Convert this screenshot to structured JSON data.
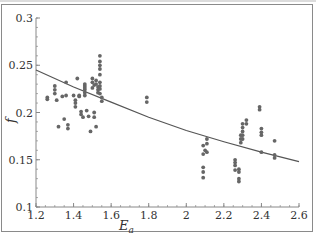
{
  "chart_data": {
    "type": "scatter",
    "title": "",
    "xlabel": "E_a",
    "ylabel": "f",
    "xlim": [
      1.2,
      2.6
    ],
    "ylim": [
      0.1,
      0.3
    ],
    "x_ticks": [
      "1.2",
      "1.4",
      "1.6",
      "1.8",
      "2",
      "2.2",
      "2.4",
      "2.6"
    ],
    "y_ticks": [
      "0.1",
      "0.15",
      "0.2",
      "0.25",
      "0.3"
    ],
    "grid": false,
    "legend": null,
    "series": [
      {
        "name": "data",
        "kind": "scatter",
        "color": "#666666",
        "points": [
          [
            1.26,
            0.216
          ],
          [
            1.26,
            0.214
          ],
          [
            1.3,
            0.228
          ],
          [
            1.3,
            0.224
          ],
          [
            1.3,
            0.22
          ],
          [
            1.31,
            0.213
          ],
          [
            1.32,
            0.185
          ],
          [
            1.34,
            0.217
          ],
          [
            1.35,
            0.193
          ],
          [
            1.36,
            0.232
          ],
          [
            1.36,
            0.218
          ],
          [
            1.37,
            0.187
          ],
          [
            1.37,
            0.183
          ],
          [
            1.4,
            0.218
          ],
          [
            1.41,
            0.213
          ],
          [
            1.41,
            0.21
          ],
          [
            1.41,
            0.206
          ],
          [
            1.42,
            0.236
          ],
          [
            1.43,
            0.218
          ],
          [
            1.43,
            0.217
          ],
          [
            1.44,
            0.201
          ],
          [
            1.44,
            0.198
          ],
          [
            1.45,
            0.195
          ],
          [
            1.46,
            0.218
          ],
          [
            1.46,
            0.221
          ],
          [
            1.46,
            0.224
          ],
          [
            1.46,
            0.226
          ],
          [
            1.46,
            0.228
          ],
          [
            1.46,
            0.23
          ],
          [
            1.47,
            0.202
          ],
          [
            1.48,
            0.196
          ],
          [
            1.49,
            0.18
          ],
          [
            1.5,
            0.232
          ],
          [
            1.5,
            0.236
          ],
          [
            1.5,
            0.226
          ],
          [
            1.51,
            0.229
          ],
          [
            1.51,
            0.2
          ],
          [
            1.51,
            0.195
          ],
          [
            1.52,
            0.185
          ],
          [
            1.52,
            0.234
          ],
          [
            1.52,
            0.23
          ],
          [
            1.53,
            0.227
          ],
          [
            1.53,
            0.224
          ],
          [
            1.53,
            0.221
          ],
          [
            1.54,
            0.26
          ],
          [
            1.54,
            0.254
          ],
          [
            1.54,
            0.25
          ],
          [
            1.54,
            0.246
          ],
          [
            1.54,
            0.24
          ],
          [
            1.54,
            0.232
          ],
          [
            1.54,
            0.228
          ],
          [
            1.54,
            0.225
          ],
          [
            1.54,
            0.22
          ],
          [
            1.55,
            0.216
          ],
          [
            1.55,
            0.212
          ],
          [
            1.79,
            0.216
          ],
          [
            1.79,
            0.211
          ],
          [
            2.09,
            0.165
          ],
          [
            2.09,
            0.156
          ],
          [
            2.09,
            0.142
          ],
          [
            2.09,
            0.137
          ],
          [
            2.09,
            0.131
          ],
          [
            2.1,
            0.16
          ],
          [
            2.11,
            0.172
          ],
          [
            2.11,
            0.167
          ],
          [
            2.11,
            0.158
          ],
          [
            2.26,
            0.15
          ],
          [
            2.26,
            0.147
          ],
          [
            2.26,
            0.144
          ],
          [
            2.26,
            0.139
          ],
          [
            2.28,
            0.14
          ],
          [
            2.28,
            0.137
          ],
          [
            2.28,
            0.13
          ],
          [
            2.28,
            0.127
          ],
          [
            2.29,
            0.168
          ],
          [
            2.29,
            0.172
          ],
          [
            2.29,
            0.176
          ],
          [
            2.3,
            0.188
          ],
          [
            2.3,
            0.184
          ],
          [
            2.3,
            0.18
          ],
          [
            2.3,
            0.176
          ],
          [
            2.3,
            0.172
          ],
          [
            2.32,
            0.192
          ],
          [
            2.32,
            0.188
          ],
          [
            2.39,
            0.206
          ],
          [
            2.39,
            0.203
          ],
          [
            2.4,
            0.183
          ],
          [
            2.4,
            0.179
          ],
          [
            2.4,
            0.176
          ],
          [
            2.4,
            0.158
          ],
          [
            2.47,
            0.17
          ],
          [
            2.47,
            0.155
          ],
          [
            2.47,
            0.152
          ]
        ]
      },
      {
        "name": "fit",
        "kind": "line",
        "color": "#555555",
        "x": [
          1.2,
          1.4,
          1.6,
          1.8,
          2.0,
          2.2,
          2.4,
          2.6
        ],
        "values": [
          0.245,
          0.227,
          0.211,
          0.195,
          0.181,
          0.169,
          0.158,
          0.148
        ]
      }
    ]
  }
}
